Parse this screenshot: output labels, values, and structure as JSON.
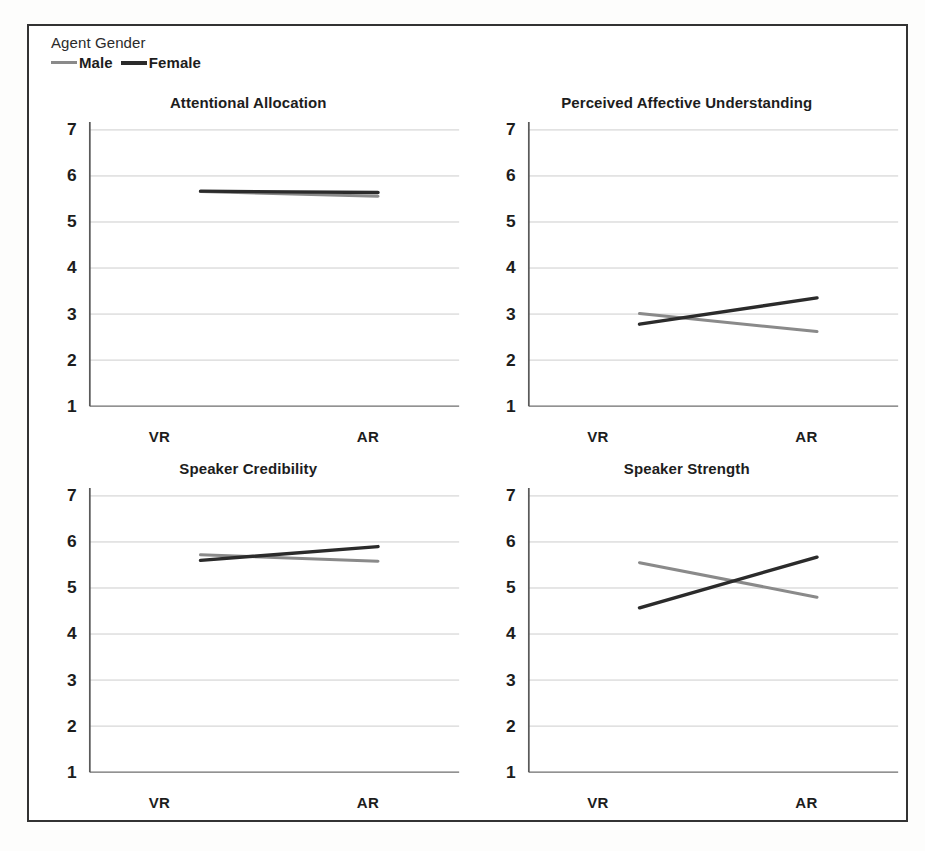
{
  "legend": {
    "title": "Agent Gender",
    "entries": [
      {
        "label": "Male",
        "color": "#8a8a8a",
        "icon": "line-swatch-icon"
      },
      {
        "label": "Female",
        "color": "#2b2b2b",
        "icon": "line-swatch-icon"
      }
    ]
  },
  "axis": {
    "y_ticks": [
      "7",
      "6",
      "5",
      "4",
      "3",
      "2",
      "1"
    ],
    "x_ticks": [
      "VR",
      "AR"
    ]
  },
  "chart_data": [
    {
      "type": "line",
      "title": "Attentional Allocation",
      "xlabel": "",
      "ylabel": "",
      "x": [
        "VR",
        "AR"
      ],
      "categories": [
        "VR",
        "AR"
      ],
      "ylim": [
        1,
        7
      ],
      "yticks": [
        1,
        2,
        3,
        4,
        5,
        6,
        7
      ],
      "grid": true,
      "legend_position": "figure-top-left",
      "series": [
        {
          "name": "Male",
          "values": [
            5.66,
            5.56
          ],
          "color": "#8a8a8a"
        },
        {
          "name": "Female",
          "values": [
            5.67,
            5.64
          ],
          "color": "#2b2b2b"
        }
      ]
    },
    {
      "type": "line",
      "title": "Perceived Affective Understanding",
      "xlabel": "",
      "ylabel": "",
      "x": [
        "VR",
        "AR"
      ],
      "categories": [
        "VR",
        "AR"
      ],
      "ylim": [
        1,
        7
      ],
      "yticks": [
        1,
        2,
        3,
        4,
        5,
        6,
        7
      ],
      "grid": true,
      "legend_position": "figure-top-left",
      "series": [
        {
          "name": "Male",
          "values": [
            3.01,
            2.62
          ],
          "color": "#8a8a8a"
        },
        {
          "name": "Female",
          "values": [
            2.78,
            3.35
          ],
          "color": "#2b2b2b"
        }
      ]
    },
    {
      "type": "line",
      "title": "Speaker Credibility",
      "xlabel": "",
      "ylabel": "",
      "x": [
        "VR",
        "AR"
      ],
      "categories": [
        "VR",
        "AR"
      ],
      "ylim": [
        1,
        7
      ],
      "yticks": [
        1,
        2,
        3,
        4,
        5,
        6,
        7
      ],
      "grid": true,
      "legend_position": "figure-top-left",
      "series": [
        {
          "name": "Male",
          "values": [
            5.72,
            5.58
          ],
          "color": "#8a8a8a"
        },
        {
          "name": "Female",
          "values": [
            5.6,
            5.9
          ],
          "color": "#2b2b2b"
        }
      ]
    },
    {
      "type": "line",
      "title": "Speaker Strength",
      "xlabel": "",
      "ylabel": "",
      "x": [
        "VR",
        "AR"
      ],
      "categories": [
        "VR",
        "AR"
      ],
      "ylim": [
        1,
        7
      ],
      "yticks": [
        1,
        2,
        3,
        4,
        5,
        6,
        7
      ],
      "grid": true,
      "legend_position": "figure-top-left",
      "series": [
        {
          "name": "Male",
          "values": [
            5.55,
            4.8
          ],
          "color": "#8a8a8a"
        },
        {
          "name": "Female",
          "values": [
            4.57,
            5.67
          ],
          "color": "#2b2b2b"
        }
      ]
    }
  ]
}
